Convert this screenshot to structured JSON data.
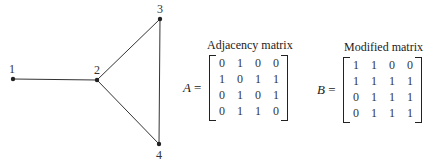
{
  "graph": {
    "nodes": [
      {
        "id": "1",
        "label": "1"
      },
      {
        "id": "2",
        "label": "2"
      },
      {
        "id": "3",
        "label": "3"
      },
      {
        "id": "4",
        "label": "4"
      }
    ],
    "edges": [
      [
        "1",
        "2"
      ],
      [
        "2",
        "3"
      ],
      [
        "2",
        "4"
      ],
      [
        "3",
        "4"
      ]
    ]
  },
  "adjacency": {
    "title": "Adjacency matrix",
    "symbol": "A",
    "equals": "=",
    "rows": [
      [
        "0",
        "1",
        "0",
        "0"
      ],
      [
        "1",
        "0",
        "1",
        "1"
      ],
      [
        "0",
        "1",
        "0",
        "1"
      ],
      [
        "0",
        "1",
        "1",
        "0"
      ]
    ]
  },
  "modified": {
    "title": "Modified matrix",
    "symbol": "B",
    "equals": "=",
    "rows": [
      [
        "1",
        "1",
        "0",
        "0"
      ],
      [
        "1",
        "1",
        "1",
        "1"
      ],
      [
        "0",
        "1",
        "1",
        "1"
      ],
      [
        "0",
        "1",
        "1",
        "1"
      ]
    ]
  }
}
